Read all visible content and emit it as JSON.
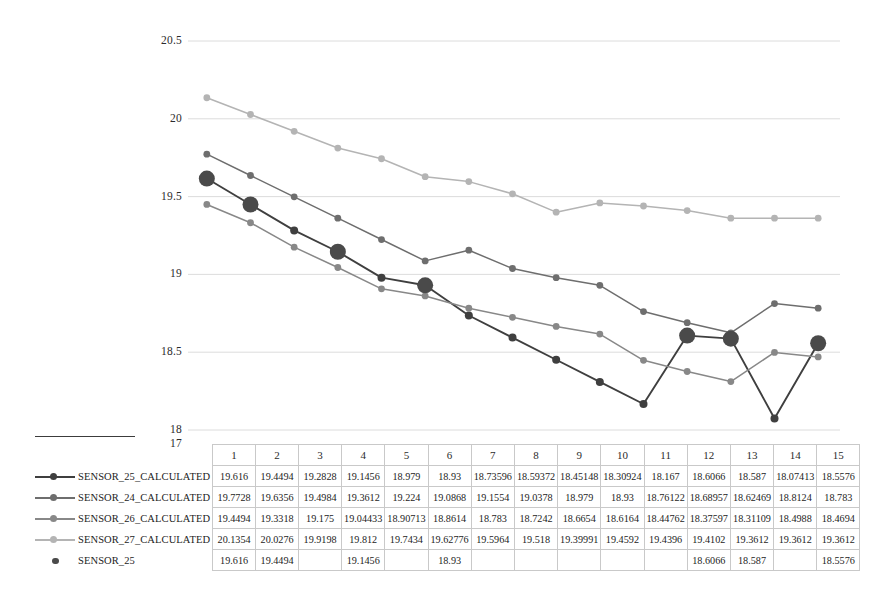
{
  "chart_data": {
    "type": "line",
    "title": "",
    "xlabel": "",
    "ylabel": "",
    "ylim": [
      17,
      20.5
    ],
    "yticks": [
      20.5,
      20,
      19.5,
      19,
      18.5,
      18,
      17
    ],
    "ytick_labels": [
      "20.5",
      "20",
      "19.5",
      "19",
      "18.5",
      "18",
      "17"
    ],
    "grid": true,
    "legend_position": "data-table-left",
    "categories": [
      "1",
      "2",
      "3",
      "4",
      "5",
      "6",
      "7",
      "8",
      "9",
      "10",
      "11",
      "12",
      "13",
      "14",
      "15"
    ],
    "series": [
      {
        "name": "SENSOR_25_CALCULATED",
        "color": "#3f3f3f",
        "marker": "circle",
        "marker_size": 4,
        "values": [
          19.616,
          19.4494,
          19.2828,
          19.1456,
          18.979,
          18.93,
          18.73596,
          18.59372,
          18.45148,
          18.30924,
          18.167,
          18.6066,
          18.587,
          18.07413,
          18.5576
        ],
        "display": [
          "19.616",
          "19.4494",
          "19.2828",
          "19.1456",
          "18.979",
          "18.93",
          "18.73596",
          "18.59372",
          "18.45148",
          "18.30924",
          "18.167",
          "18.6066",
          "18.587",
          "18.07413",
          "18.5576"
        ]
      },
      {
        "name": "SENSOR_24_CALCULATED",
        "color": "#6e6e6e",
        "marker": "circle",
        "marker_size": 3.4,
        "values": [
          19.7728,
          19.6356,
          19.4984,
          19.3612,
          19.224,
          19.0868,
          19.1554,
          19.0378,
          18.979,
          18.93,
          18.76122,
          18.68957,
          18.62469,
          18.8124,
          18.783
        ],
        "display": [
          "19.7728",
          "19.6356",
          "19.4984",
          "19.3612",
          "19.224",
          "19.0868",
          "19.1554",
          "19.0378",
          "18.979",
          "18.93",
          "18.76122",
          "18.68957",
          "18.62469",
          "18.8124",
          "18.783"
        ]
      },
      {
        "name": "SENSOR_26_CALCULATED",
        "color": "#888888",
        "marker": "circle",
        "marker_size": 3.4,
        "values": [
          19.4494,
          19.3318,
          19.175,
          19.04433,
          18.90713,
          18.8614,
          18.783,
          18.7242,
          18.6654,
          18.6164,
          18.44762,
          18.37597,
          18.31109,
          18.4988,
          18.4694
        ],
        "display": [
          "19.4494",
          "19.3318",
          "19.175",
          "19.04433",
          "18.90713",
          "18.8614",
          "18.783",
          "18.7242",
          "18.6654",
          "18.6164",
          "18.44762",
          "18.37597",
          "18.31109",
          "18.4988",
          "18.4694"
        ]
      },
      {
        "name": "SENSOR_27_CALCULATED",
        "color": "#b4b4b4",
        "marker": "circle",
        "marker_size": 3.4,
        "values": [
          20.1354,
          20.0276,
          19.9198,
          19.812,
          19.7434,
          19.62776,
          19.5964,
          19.518,
          19.39991,
          19.4592,
          19.4396,
          19.4102,
          19.3612,
          19.3612,
          19.3612
        ],
        "display": [
          "20.1354",
          "20.0276",
          "19.9198",
          "19.812",
          "19.7434",
          "19.62776",
          "19.5964",
          "19.518",
          "19.39991",
          "19.4592",
          "19.4396",
          "19.4102",
          "19.3612",
          "19.3612",
          "19.3612"
        ]
      },
      {
        "name": "SENSOR_25",
        "color": "#4a4a4a",
        "marker": "circle-large",
        "marker_size": 8,
        "line": false,
        "values": [
          19.616,
          19.4494,
          null,
          19.1456,
          null,
          18.93,
          null,
          null,
          null,
          null,
          null,
          18.6066,
          18.587,
          null,
          18.5576
        ],
        "display": [
          "19.616",
          "19.4494",
          "",
          "19.1456",
          "",
          "18.93",
          "",
          "",
          "",
          "",
          "",
          "18.6066",
          "18.587",
          "",
          "18.5576"
        ]
      }
    ]
  },
  "colors": {
    "grid": "#d8d8d8",
    "table_border": "#c9c9c9",
    "text": "#232323",
    "rule": "#3c3c3c"
  }
}
